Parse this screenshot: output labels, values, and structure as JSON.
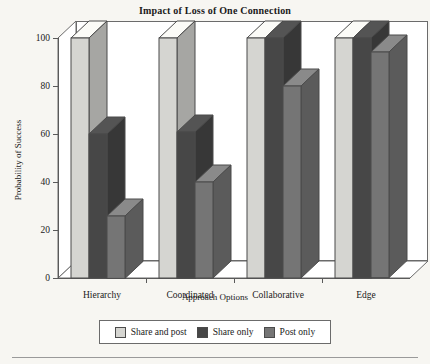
{
  "chart_data": {
    "type": "bar",
    "title": "Impact of Loss of One Connection",
    "xlabel": "Approach Options",
    "ylabel": "Probability of Success",
    "categories": [
      "Hierarchy",
      "Coordinated",
      "Collaborative",
      "Edge"
    ],
    "series": [
      {
        "name": "Share and post",
        "color": "#d5d5d1",
        "values": [
          100,
          100,
          100,
          100
        ]
      },
      {
        "name": "Share only",
        "color": "#474747",
        "values": [
          60,
          61,
          100,
          100
        ]
      },
      {
        "name": "Post only",
        "color": "#757575",
        "values": [
          26,
          40,
          80,
          94
        ]
      }
    ],
    "ylim": [
      0,
      100
    ],
    "yticks": [
      0,
      20,
      40,
      60,
      80,
      100
    ],
    "grid": false,
    "legend_position": "bottom",
    "projection": "3d"
  },
  "legend": {
    "items": [
      {
        "label": "Share and post"
      },
      {
        "label": "Share only"
      },
      {
        "label": "Post only"
      }
    ]
  }
}
